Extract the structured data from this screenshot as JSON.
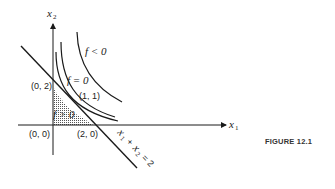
{
  "figure": {
    "caption": "FIGURE 12.1",
    "axes": {
      "x_label": "x",
      "x_sub": "1",
      "y_label": "x",
      "y_sub": "2"
    },
    "points": [
      {
        "id": "origin",
        "label": "(0, 0)"
      },
      {
        "id": "p02",
        "label": "(0, 2)"
      },
      {
        "id": "p20",
        "label": "(2, 0)"
      },
      {
        "id": "p11",
        "label": "(1, 1)"
      }
    ],
    "regions": {
      "negative": "f < 0",
      "zero": "f = 0",
      "positive": "f > 0"
    },
    "constraint": {
      "x": "x",
      "x1sub": "1",
      "plus": "+",
      "x2sub": "2",
      "eq": "= 2"
    },
    "colors": {
      "ink": "#1a1a1a",
      "shading": "#9a9a9a"
    }
  }
}
